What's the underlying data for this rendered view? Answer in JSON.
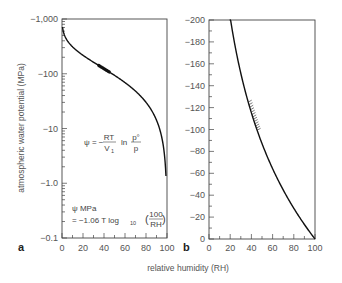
{
  "chart_data": [
    {
      "panel": "a",
      "type": "line",
      "title": "",
      "xlabel": "relative humidity (RH)",
      "ylabel": "atmospheric water potential (MPa)",
      "yscale": "log",
      "xlim": [
        0,
        100
      ],
      "ylim": [
        -0.1,
        -1000
      ],
      "x_ticks": [
        "0",
        "20",
        "40",
        "60",
        "80",
        "100"
      ],
      "y_ticks": [
        "-1,000",
        "-100",
        "-10",
        "-1.0",
        "-0.1"
      ],
      "series": [
        {
          "name": "psi vs RH",
          "x": [
            1,
            5,
            10,
            20,
            30,
            40,
            50,
            60,
            70,
            80,
            90,
            95,
            99
          ],
          "values": [
            -630,
            -416,
            -318,
            -223,
            -167,
            -126,
            -95,
            -71,
            -49,
            -31,
            -14.6,
            -7.1,
            -1.4
          ]
        }
      ],
      "highlight": {
        "x_range": [
          35,
          45
        ],
        "note": "thickened segment near -110 MPa"
      },
      "annotations": [
        "ψ = −(RT/V₁) ln (p°/p)",
        "ψ MPa = −1.06 T log₁₀ (100/RH)"
      ],
      "grid": false
    },
    {
      "panel": "b",
      "type": "line",
      "title": "",
      "xlabel": "relative humidity (RH)",
      "ylabel": "",
      "yscale": "linear",
      "xlim": [
        0,
        100
      ],
      "ylim": [
        0,
        -200
      ],
      "x_ticks": [
        "0",
        "20",
        "40",
        "60",
        "80",
        "100"
      ],
      "y_ticks": [
        "-200",
        "-180",
        "-160",
        "-140",
        "-120",
        "-100",
        "-80",
        "-60",
        "-40",
        "-20",
        "0"
      ],
      "series": [
        {
          "name": "psi vs RH",
          "x": [
            20,
            30,
            40,
            50,
            60,
            70,
            80,
            90,
            100
          ],
          "values": [
            -200,
            -163,
            -124,
            -94,
            -69,
            -48,
            -30,
            -14,
            0
          ]
        }
      ],
      "highlight": {
        "x_range": [
          37,
          46
        ],
        "note": "hatched band between approx -125 and -95 MPa"
      },
      "grid": false
    }
  ],
  "labels": {
    "panel_a": "a",
    "panel_b": "b",
    "xlabel": "relative humidity (RH)",
    "ylabel": "atmospheric water potential (MPa)",
    "eq1_lhs": "ψ = −",
    "eq1_num": "RT",
    "eq1_den": "V",
    "eq1_sub": "1",
    "eq1_ln": "ln",
    "eq1_pnum": "p°",
    "eq1_pden": "p",
    "eq2_line1": "ψ MPa",
    "eq2_line2": "= −1.06 T log",
    "eq2_sub": "10",
    "eq2_num": "100",
    "eq2_den": "RH"
  },
  "axis_ticks": {
    "a_y": [
      "−1,000",
      "−100",
      "−10",
      "−1.0",
      "−0.1"
    ],
    "a_x": [
      "0",
      "20",
      "40",
      "60",
      "80",
      "100"
    ],
    "b_y": [
      "−200",
      "−180",
      "−160",
      "−140",
      "−120",
      "−100",
      "−80",
      "−60",
      "−40",
      "−20",
      "0"
    ],
    "b_x": [
      "0",
      "20",
      "40",
      "60",
      "80",
      "100"
    ]
  }
}
